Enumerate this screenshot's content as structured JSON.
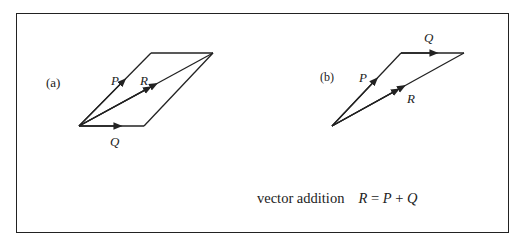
{
  "figure": {
    "panels": [
      {
        "id": "a",
        "tag": "(a)",
        "type": "parallelogram",
        "labels": {
          "P": "P",
          "Q": "Q",
          "R": "R"
        }
      },
      {
        "id": "b",
        "tag": "(b)",
        "type": "triangle",
        "labels": {
          "P": "P",
          "Q": "Q",
          "R": "R"
        }
      }
    ],
    "caption": {
      "text": "vector addition",
      "eq_R": "R",
      "eq_eq": " = ",
      "eq_P": "P",
      "eq_plus": " + ",
      "eq_Q": "Q"
    }
  },
  "colors": {
    "stroke": "#222222",
    "background": "#ffffff"
  }
}
